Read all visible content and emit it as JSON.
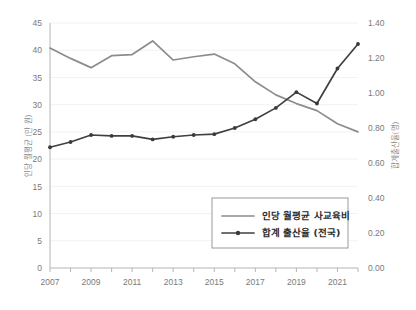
{
  "chart_data": {
    "type": "line",
    "title": "",
    "xlabel": "",
    "ylabel": "인당 월평균 (만 원)",
    "y2label": "합계출산율(명)",
    "grid": true,
    "legend_position": "bottom-right",
    "x": [
      2007,
      2008,
      2009,
      2010,
      2011,
      2012,
      2013,
      2014,
      2015,
      2016,
      2017,
      2018,
      2019,
      2020,
      2021,
      2022
    ],
    "xtick_labels": [
      "2007",
      "2009",
      "2011",
      "2013",
      "2015",
      "2017",
      "2019",
      "2021"
    ],
    "xtick_values": [
      2007,
      2009,
      2011,
      2013,
      2015,
      2017,
      2019,
      2021
    ],
    "xlim": [
      2007,
      2022
    ],
    "ylim": [
      0,
      45
    ],
    "ytick_labels": [
      "0",
      "5",
      "10",
      "15",
      "20",
      "25",
      "30",
      "35",
      "40",
      "45"
    ],
    "ytick_values": [
      0,
      5,
      10,
      15,
      20,
      25,
      30,
      35,
      40,
      45
    ],
    "y2lim": [
      0.0,
      1.4
    ],
    "y2tick_labels": [
      "0.00",
      "0.20",
      "0.40",
      "0.60",
      "0.80",
      "1.00",
      "1.20",
      "1.40"
    ],
    "y2tick_values": [
      0.0,
      0.2,
      0.4,
      0.6,
      0.8,
      1.0,
      1.2,
      1.4
    ],
    "series": [
      {
        "name": "인당 월평균 사교육비",
        "axis": "left",
        "color": "#8c8c8c",
        "markers": false,
        "values": [
          40.4,
          38.5,
          36.8,
          39.0,
          39.2,
          41.7,
          38.2,
          38.8,
          39.3,
          37.5,
          34.2,
          31.8,
          30.2,
          28.9,
          26.5,
          25.0
        ]
      },
      {
        "name": "합계 출산율 (전국)",
        "axis": "right",
        "color": "#3a3a3a",
        "markers": true,
        "values": [
          0.69,
          0.72,
          0.76,
          0.755,
          0.755,
          0.735,
          0.75,
          0.76,
          0.765,
          0.8,
          0.85,
          0.915,
          1.005,
          0.94,
          1.14,
          1.28
        ]
      }
    ]
  },
  "legend": {
    "items": [
      {
        "label": "인당 월평균 사교육비"
      },
      {
        "label": "합계 출산율 (전국)"
      }
    ]
  }
}
